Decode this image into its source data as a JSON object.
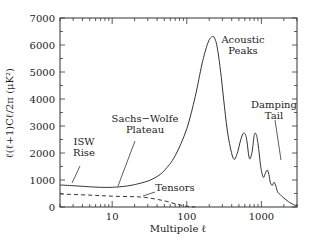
{
  "chart_data": {
    "type": "line",
    "title": "",
    "xlabel": "Multipole ℓ",
    "ylabel": "ℓ(ℓ+1)Cℓ/2π (μK²)",
    "xscale": "log",
    "xlim": [
      2,
      3000
    ],
    "ylim": [
      0,
      7000
    ],
    "grid": false,
    "legend": null,
    "x_ticks": [
      10,
      100,
      1000
    ],
    "x_tick_labels": [
      "10",
      "100",
      "1000"
    ],
    "y_ticks": [
      0,
      1000,
      2000,
      3000,
      4000,
      5000,
      6000,
      7000
    ],
    "y_tick_labels": [
      "0",
      "1000",
      "2000",
      "3000",
      "4000",
      "5000",
      "6000",
      "7000"
    ],
    "series": [
      {
        "name": "Scalar (total)",
        "style": "solid",
        "x": [
          2,
          3,
          5,
          7,
          10,
          15,
          20,
          30,
          40,
          50,
          70,
          100,
          130,
          160,
          190,
          215,
          237,
          260,
          290,
          320,
          360,
          420,
          470,
          530,
          580,
          630,
          690,
          750,
          800,
          850,
          900,
          980,
          1060,
          1130,
          1200,
          1260,
          1320,
          1400,
          1480,
          1560,
          1650,
          1800,
          2000,
          2300,
          2600,
          3000
        ],
        "values": [
          815,
          790,
          750,
          730,
          730,
          770,
          830,
          960,
          1130,
          1350,
          1900,
          2900,
          4100,
          5300,
          6050,
          6300,
          6250,
          5800,
          4800,
          3700,
          2600,
          1800,
          1950,
          2500,
          2740,
          2550,
          1800,
          2050,
          2650,
          2700,
          2350,
          1500,
          1100,
          1250,
          1370,
          1200,
          900,
          800,
          920,
          780,
          560,
          450,
          330,
          200,
          110,
          40
        ]
      },
      {
        "name": "Tensors",
        "style": "dashed",
        "x": [
          2,
          5,
          10,
          20,
          30,
          50,
          70,
          100,
          130
        ],
        "values": [
          480,
          440,
          400,
          380,
          340,
          230,
          120,
          30,
          0
        ]
      }
    ],
    "annotations": [
      {
        "text": [
          "ISW",
          "Rise"
        ],
        "x_px": 84,
        "y_px": 145
      },
      {
        "text": [
          "Sachs−Wolfe",
          "Plateau"
        ],
        "x_px": 145,
        "y_px": 122
      },
      {
        "text": [
          "Acoustic",
          "Peaks"
        ],
        "x_px": 243,
        "y_px": 43
      },
      {
        "text": [
          "Damping",
          "Tail"
        ],
        "x_px": 274,
        "y_px": 108
      },
      {
        "text": [
          "Tensors"
        ],
        "x_px": 175,
        "y_px": 191
      }
    ]
  }
}
